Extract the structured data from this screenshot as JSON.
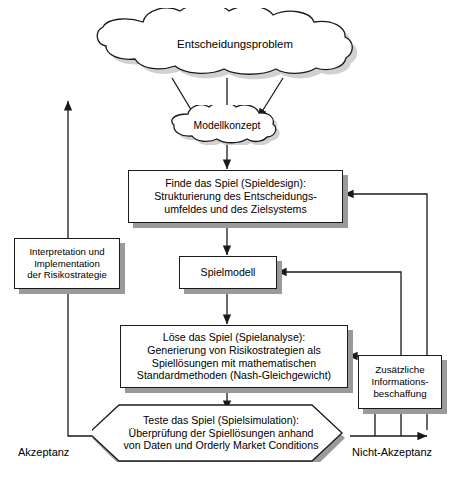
{
  "diagram": {
    "language": "de",
    "stroke_color": "#1a1a1a",
    "shadow_color": "#9a9a9a",
    "background": "#ffffff"
  },
  "nodes": {
    "entscheidungsproblem": {
      "label": "Entscheidungsproblem",
      "shape": "cloud"
    },
    "modellkonzept": {
      "label": "Modellkonzept",
      "shape": "cloud"
    },
    "finde_das_spiel": {
      "label": "Finde das Spiel (Spieldesign):\nStrukturierung des Entscheidungs-\numfeldes und des Zielsystems",
      "shape": "rectangle"
    },
    "spielmodell": {
      "label": "Spielmodell",
      "shape": "rectangle"
    },
    "loese_das_spiel": {
      "label": "Löse das Spiel (Spielanalyse):\nGenerierung von Risikostrategien als\nSpiellösungen mit mathematischen\nStandardmethoden (Nash-Gleichgewicht)",
      "shape": "rectangle"
    },
    "teste_das_spiel": {
      "label": "Teste das Spiel (Spielsimulation):\nÜberprüfung der Spiellösungen anhand\nvon Daten und Orderly Market Conditions",
      "shape": "hexagon"
    },
    "interpretation": {
      "label": "Interpretation und\nImplementation\nder Risikostrategie",
      "shape": "rectangle"
    },
    "zusaetzliche_info": {
      "label": "Zusätzliche\nInformations-\nbeschaffung",
      "shape": "rectangle"
    }
  },
  "edge_labels": {
    "akzeptanz": "Akzeptanz",
    "nicht_akzeptanz": "Nicht-Akzeptanz"
  }
}
